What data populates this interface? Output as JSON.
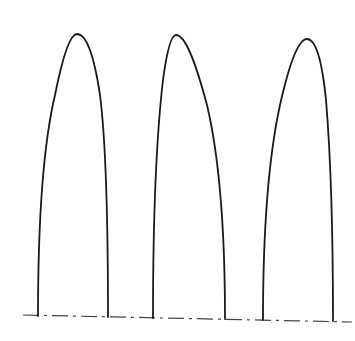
{
  "figure": {
    "stroke_color": "#1a1a1a",
    "baseline_color": "#444444",
    "background": "#ffffff",
    "arches": [
      {
        "label": "arch-1",
        "base_left": [
          38,
          316
        ],
        "base_right": [
          108,
          317
        ],
        "apex": [
          77,
          34
        ],
        "path": "M38,316 C38,230 42,150 55,95 C62,60 70,34 77,34 C86,34 94,55 100,95 C107,150 108,230 108,317"
      },
      {
        "label": "arch-2",
        "base_left": [
          153,
          318
        ],
        "base_right": [
          225,
          319
        ],
        "apex": [
          176,
          35
        ],
        "path": "M153,318 C153,230 156,140 163,80 C167,50 171,35 176,35 C185,35 195,60 207,105 C220,160 225,240 225,319"
      },
      {
        "label": "arch-3",
        "base_left": [
          263,
          320
        ],
        "base_right": [
          333,
          321
        ],
        "apex": [
          307,
          39
        ],
        "path": "M263,320 C263,240 268,160 280,105 C289,65 298,39 307,39 C316,39 322,60 326,100 C331,160 333,240 333,321"
      }
    ],
    "baseline": {
      "style": "dash-dot",
      "start": [
        23,
        315
      ],
      "end": [
        352,
        322
      ],
      "dasharray": "16 5 3 5"
    }
  }
}
